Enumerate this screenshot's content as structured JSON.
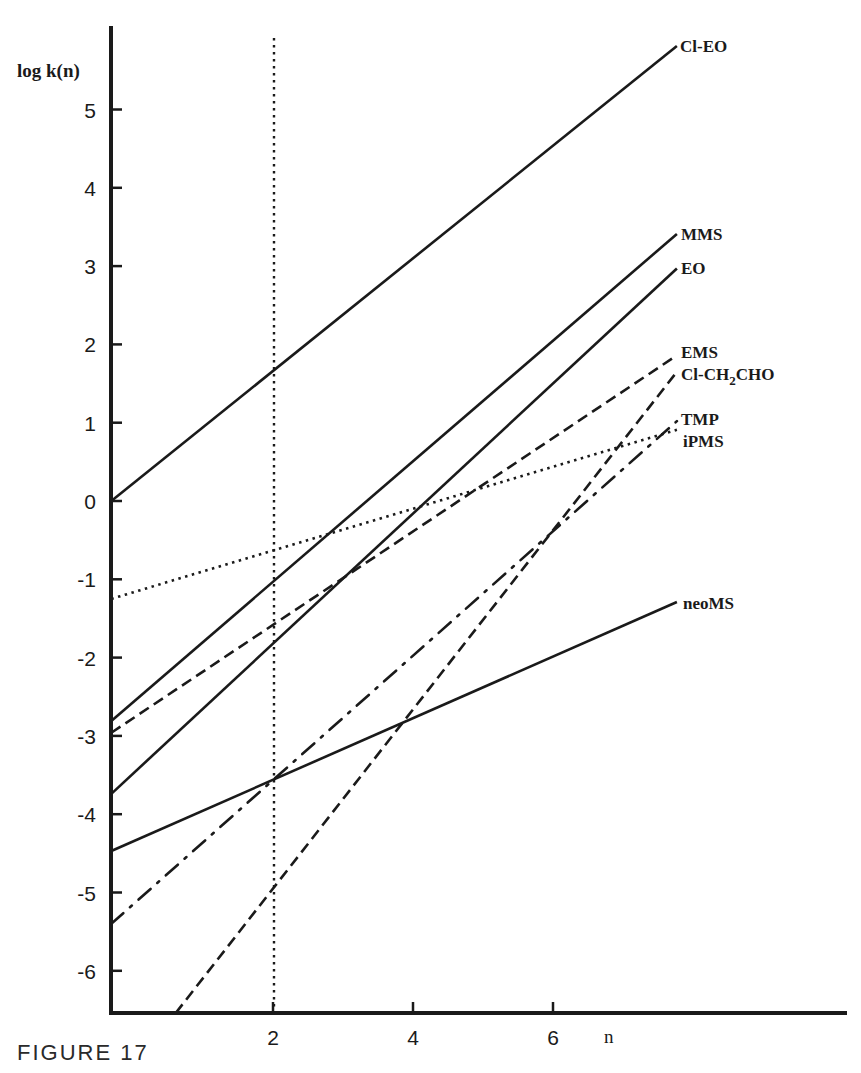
{
  "caption": "FIGURE 17",
  "chart_data": {
    "type": "line",
    "title": "",
    "xlabel": "n",
    "ylabel": "log k(n)",
    "x_ticks": [
      2,
      4,
      6
    ],
    "y_ticks": [
      5,
      4,
      3,
      2,
      1,
      0,
      -1,
      -2,
      -3,
      -4,
      -5,
      -6
    ],
    "xlim": [
      -0.31,
      10.1
    ],
    "ylim": [
      -6.54,
      6.1
    ],
    "grid": false,
    "legend_position": "inline labels at right end of each line",
    "reference_lines": [
      {
        "orientation": "vertical",
        "x": 2,
        "style": "dotted",
        "y_range": [
          -6.54,
          5.9
        ]
      }
    ],
    "series": [
      {
        "name": "Cl-EO",
        "style": "solid",
        "x": [
          -0.31,
          7.77
        ],
        "values": [
          0.0,
          5.81
        ]
      },
      {
        "name": "MMS",
        "style": "solid",
        "x": [
          -0.31,
          7.77
        ],
        "values": [
          -2.81,
          3.41
        ]
      },
      {
        "name": "EO",
        "style": "solid",
        "x": [
          -0.31,
          7.77
        ],
        "values": [
          -3.74,
          2.97
        ]
      },
      {
        "name": "EMS",
        "style": "dashed",
        "x": [
          -0.31,
          7.77
        ],
        "values": [
          -2.96,
          1.86
        ]
      },
      {
        "name": "Cl-CH2CHO",
        "style": "dashed",
        "x": [
          0.61,
          7.77
        ],
        "values": [
          -6.54,
          1.65
        ]
      },
      {
        "name": "TMP",
        "style": "dash-dot",
        "x": [
          -0.31,
          7.77
        ],
        "values": [
          -5.4,
          1.02
        ]
      },
      {
        "name": "iPMS",
        "style": "dotted",
        "x": [
          -0.31,
          7.77
        ],
        "values": [
          -1.25,
          0.91
        ]
      },
      {
        "name": "neoMS",
        "style": "solid",
        "x": [
          -0.31,
          7.77
        ],
        "values": [
          -4.47,
          -1.29
        ]
      }
    ]
  },
  "labels": {
    "Cl-EO": {
      "text": "Cl-EO",
      "pos": [
        680,
        52
      ]
    },
    "MMS": {
      "text": "MMS",
      "pos": [
        681,
        240
      ]
    },
    "EO": {
      "text": "EO",
      "pos": [
        681,
        274
      ]
    },
    "EMS": {
      "text": "EMS",
      "pos": [
        681,
        358
      ]
    },
    "Cl-CH2CHO": {
      "text": "Cl-CH",
      "sub": "2",
      "tail": "CHO",
      "pos": [
        681,
        380
      ]
    },
    "TMP": {
      "text": "TMP",
      "pos": [
        681,
        425
      ]
    },
    "iPMS": {
      "text": "iPMS",
      "pos": [
        683,
        447
      ]
    },
    "neoMS": {
      "text": "neoMS",
      "pos": [
        683,
        609
      ]
    }
  }
}
